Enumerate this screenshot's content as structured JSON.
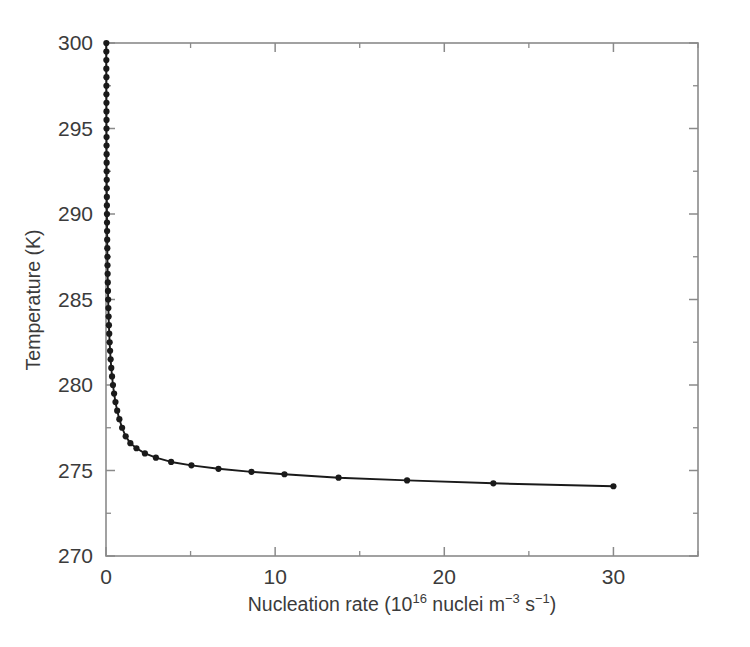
{
  "figure": {
    "background": "#ffffff",
    "axis_color": "#8a8a8a",
    "data_color": "#1a1a1a",
    "text_color": "#3b3b3b"
  },
  "axis_titles": {
    "x_prefix": "Nucleation rate (10",
    "x_exponent": "16",
    "x_middle": " nuclei m",
    "x_sup1": "−3",
    "x_sp": " s",
    "x_sup2": "−1",
    "x_suffix": ")",
    "x_full": "Nucleation rate (10¹⁶ nuclei m⁻³ s⁻¹)",
    "y_full": "Temperature (K)"
  },
  "chart_data": {
    "type": "line",
    "title": "",
    "xlabel": "Nucleation rate (10^16 nuclei m^-3 s^-1)",
    "ylabel": "Temperature (K)",
    "xlim": [
      0,
      35
    ],
    "ylim": [
      270,
      300
    ],
    "grid": false,
    "legend": null,
    "x_ticks": [
      0,
      10,
      20,
      30
    ],
    "x_ticklabels": [
      "0",
      "10",
      "20",
      "30"
    ],
    "x_minor_ticks": [
      5,
      15,
      25,
      35
    ],
    "y_ticks": [
      270,
      275,
      280,
      285,
      290,
      295,
      300
    ],
    "y_ticklabels": [
      "270",
      "275",
      "280",
      "285",
      "290",
      "295",
      "300"
    ],
    "y_minor_ticks": [
      272.5,
      277.5,
      282.5,
      287.5,
      292.5,
      297.5
    ],
    "marker": "circle",
    "marker_size": 3.1,
    "series": [
      {
        "name": "nucleation rate vs temperature",
        "x": [
          0.0008,
          0.001,
          0.0012,
          0.0015,
          0.0019,
          0.0024,
          0.003,
          0.0038,
          0.0048,
          0.006,
          0.0076,
          0.0095,
          0.012,
          0.0151,
          0.019,
          0.0239,
          0.03,
          0.0377,
          0.0474,
          0.0596,
          0.0749,
          0.0941,
          0.1183,
          0.1487,
          0.1869,
          0.2349,
          0.2952,
          0.371,
          0.4663,
          0.586,
          0.7365,
          0.9256,
          1.163,
          1.462,
          1.838,
          2.31,
          2.903,
          3.649,
          4.586,
          5.764,
          7.245,
          9.106,
          11.44,
          14.38,
          18.07,
          22.71,
          30.0
        ],
        "y": [
          300.0,
          299.5,
          299.0,
          298.5,
          298.0,
          297.5,
          297.0,
          296.5,
          296.0,
          295.5,
          295.0,
          294.5,
          294.0,
          293.5,
          293.0,
          292.5,
          292.0,
          291.5,
          291.0,
          290.5,
          290.0,
          289.5,
          289.0,
          288.5,
          288.0,
          287.5,
          287.0,
          286.5,
          286.0,
          285.5,
          285.0,
          284.5,
          284.0,
          283.5,
          283.0,
          282.5,
          282.0,
          281.5,
          281.0,
          280.5,
          280.0,
          279.5,
          279.0,
          278.5,
          278.0,
          277.5,
          277.0
        ],
        "note": "Plotted as T on the vertical axis against nucleation rate on the horizontal axis; the rendered curve is the monotone decreasing branch from T=300 at rate~0 down to T~274.1 at rate=30."
      }
    ],
    "rendered_curve": {
      "description": "Temperature falls near-vertically at rate~0 from 300 K to a knee near 275.5 K, then decays slowly to about 274.1 K at rate 30.",
      "points": [
        [
          0.02,
          300.0
        ],
        [
          0.02,
          299.5
        ],
        [
          0.02,
          299.0
        ],
        [
          0.02,
          298.5
        ],
        [
          0.025,
          298.0
        ],
        [
          0.025,
          297.5
        ],
        [
          0.025,
          297.0
        ],
        [
          0.028,
          296.5
        ],
        [
          0.028,
          296.0
        ],
        [
          0.03,
          295.5
        ],
        [
          0.03,
          295.0
        ],
        [
          0.033,
          294.5
        ],
        [
          0.033,
          294.0
        ],
        [
          0.036,
          293.5
        ],
        [
          0.038,
          293.0
        ],
        [
          0.04,
          292.5
        ],
        [
          0.043,
          292.0
        ],
        [
          0.046,
          291.5
        ],
        [
          0.049,
          291.0
        ],
        [
          0.052,
          290.5
        ],
        [
          0.056,
          290.0
        ],
        [
          0.06,
          289.5
        ],
        [
          0.065,
          289.0
        ],
        [
          0.07,
          288.5
        ],
        [
          0.076,
          288.0
        ],
        [
          0.082,
          287.5
        ],
        [
          0.089,
          287.0
        ],
        [
          0.097,
          286.5
        ],
        [
          0.106,
          286.0
        ],
        [
          0.116,
          285.5
        ],
        [
          0.127,
          285.0
        ],
        [
          0.14,
          284.5
        ],
        [
          0.155,
          284.0
        ],
        [
          0.172,
          283.5
        ],
        [
          0.192,
          283.0
        ],
        [
          0.215,
          282.5
        ],
        [
          0.242,
          282.0
        ],
        [
          0.274,
          281.5
        ],
        [
          0.312,
          281.0
        ],
        [
          0.357,
          280.5
        ],
        [
          0.412,
          280.0
        ],
        [
          0.478,
          279.5
        ],
        [
          0.56,
          279.0
        ],
        [
          0.661,
          278.5
        ],
        [
          0.789,
          278.0
        ],
        [
          0.952,
          277.5
        ],
        [
          1.163,
          277.0
        ],
        [
          1.44,
          276.6
        ],
        [
          1.8,
          276.3
        ],
        [
          2.3,
          276.0
        ],
        [
          2.95,
          275.75
        ],
        [
          3.85,
          275.5
        ],
        [
          5.05,
          275.3
        ],
        [
          6.65,
          275.1
        ],
        [
          8.6,
          274.92
        ],
        [
          10.55,
          274.78
        ],
        [
          13.75,
          274.58
        ],
        [
          17.8,
          274.42
        ],
        [
          22.9,
          274.25
        ],
        [
          30.0,
          274.08
        ]
      ]
    }
  }
}
